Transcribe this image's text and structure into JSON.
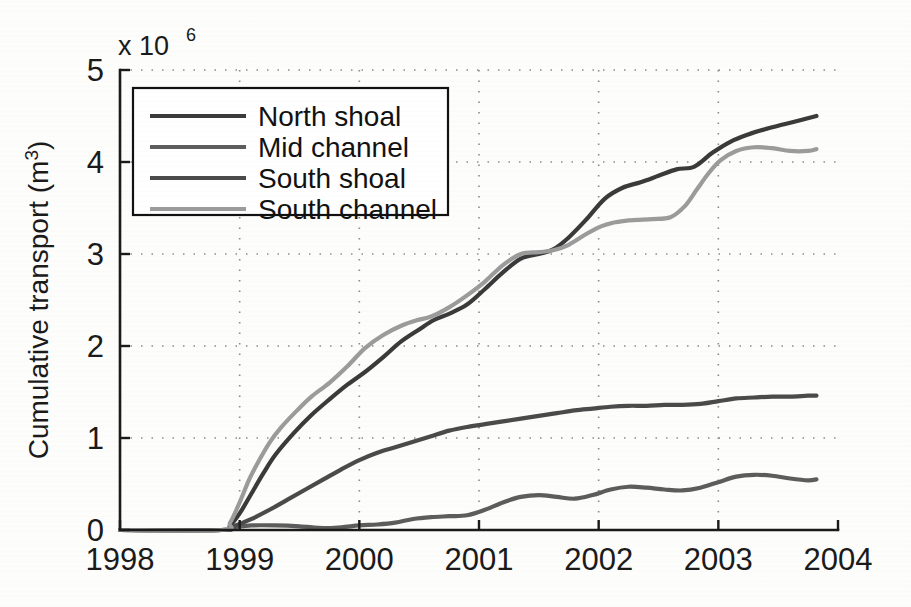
{
  "chart_data": {
    "type": "line",
    "title": "",
    "subtitle": "",
    "xlabel": "",
    "ylabel": "Cumulative transport (m",
    "ylabel_sup": "3",
    "ylabel_suffix": ")",
    "y_exponent_base": "x 10",
    "y_exponent_sup": "6",
    "y_scale_note": "Values in millions (x 10^6) of cubic metres",
    "xlim": [
      1998,
      2004
    ],
    "ylim": [
      0,
      5
    ],
    "xticks": [
      1998,
      1999,
      2000,
      2001,
      2002,
      2003,
      2004
    ],
    "xtick_labels": [
      "1998",
      "1999",
      "2000",
      "2001",
      "2002",
      "2003",
      "2004"
    ],
    "yticks": [
      0,
      1,
      2,
      3,
      4,
      5
    ],
    "ytick_labels": [
      "0",
      "1",
      "2",
      "3",
      "4",
      "5"
    ],
    "grid": true,
    "grid_style": "dotted",
    "legend_position": "upper-left",
    "legend_entries": [
      "North shoal",
      "Mid channel",
      "South shoal",
      "South channel"
    ],
    "series": [
      {
        "name": "North shoal",
        "color": "#3a3a3a",
        "x": [
          1998.0,
          1998.85,
          1998.92,
          1999.0,
          1999.1,
          1999.2,
          1999.3,
          1999.45,
          1999.6,
          1999.75,
          1999.9,
          2000.05,
          2000.2,
          2000.35,
          2000.5,
          2000.62,
          2000.75,
          2000.9,
          2001.05,
          2001.2,
          2001.35,
          2001.5,
          2001.62,
          2001.75,
          2001.9,
          2002.05,
          2002.2,
          2002.35,
          2002.5,
          2002.65,
          2002.8,
          2002.95,
          2003.1,
          2003.25,
          2003.4,
          2003.55,
          2003.7,
          2003.82
        ],
        "y": [
          0.0,
          0.0,
          0.05,
          0.18,
          0.4,
          0.62,
          0.82,
          1.05,
          1.25,
          1.42,
          1.58,
          1.72,
          1.88,
          2.05,
          2.18,
          2.28,
          2.35,
          2.45,
          2.62,
          2.8,
          2.95,
          3.0,
          3.05,
          3.18,
          3.38,
          3.6,
          3.72,
          3.78,
          3.85,
          3.92,
          3.95,
          4.1,
          4.22,
          4.3,
          4.36,
          4.41,
          4.46,
          4.5
        ]
      },
      {
        "name": "Mid channel",
        "color": "#5c5c5c",
        "x": [
          1998.0,
          1998.85,
          1998.95,
          1999.1,
          1999.3,
          1999.5,
          1999.7,
          1999.85,
          2000.0,
          2000.15,
          2000.3,
          2000.45,
          2000.6,
          2000.75,
          2000.9,
          2001.05,
          2001.2,
          2001.35,
          2001.5,
          2001.65,
          2001.8,
          2001.95,
          2002.1,
          2002.25,
          2002.4,
          2002.55,
          2002.7,
          2002.85,
          2003.0,
          2003.15,
          2003.3,
          2003.45,
          2003.6,
          2003.75,
          2003.82
        ],
        "y": [
          0.0,
          0.0,
          0.03,
          0.05,
          0.05,
          0.04,
          0.02,
          0.03,
          0.05,
          0.06,
          0.08,
          0.12,
          0.14,
          0.15,
          0.16,
          0.22,
          0.3,
          0.36,
          0.38,
          0.36,
          0.34,
          0.38,
          0.44,
          0.47,
          0.46,
          0.44,
          0.43,
          0.46,
          0.52,
          0.58,
          0.6,
          0.59,
          0.56,
          0.54,
          0.55
        ]
      },
      {
        "name": "South shoal",
        "color": "#4a4a4a",
        "x": [
          1998.0,
          1998.85,
          1998.95,
          1999.1,
          1999.25,
          1999.4,
          1999.55,
          1999.7,
          1999.85,
          2000.0,
          2000.15,
          2000.3,
          2000.45,
          2000.6,
          2000.75,
          2000.9,
          2001.05,
          2001.2,
          2001.35,
          2001.5,
          2001.65,
          2001.8,
          2001.95,
          2002.1,
          2002.25,
          2002.4,
          2002.55,
          2002.7,
          2002.85,
          2003.0,
          2003.15,
          2003.3,
          2003.45,
          2003.6,
          2003.75,
          2003.82
        ],
        "y": [
          0.0,
          0.0,
          0.04,
          0.12,
          0.22,
          0.33,
          0.44,
          0.55,
          0.66,
          0.76,
          0.84,
          0.9,
          0.96,
          1.02,
          1.08,
          1.12,
          1.15,
          1.18,
          1.21,
          1.24,
          1.27,
          1.3,
          1.32,
          1.34,
          1.35,
          1.35,
          1.36,
          1.36,
          1.37,
          1.4,
          1.43,
          1.44,
          1.45,
          1.45,
          1.46,
          1.46
        ]
      },
      {
        "name": "South channel",
        "color": "#9b9b9b",
        "x": [
          1998.0,
          1998.85,
          1998.92,
          1999.0,
          1999.08,
          1999.16,
          1999.25,
          1999.35,
          1999.48,
          1999.6,
          1999.75,
          1999.9,
          2000.05,
          2000.2,
          2000.35,
          2000.48,
          2000.6,
          2000.75,
          2000.9,
          2001.05,
          2001.2,
          2001.35,
          2001.5,
          2001.62,
          2001.75,
          2001.9,
          2002.02,
          2002.12,
          2002.22,
          2002.32,
          2002.45,
          2002.6,
          2002.72,
          2002.82,
          2002.92,
          2003.02,
          2003.15,
          2003.3,
          2003.45,
          2003.6,
          2003.75,
          2003.82
        ],
        "y": [
          0.0,
          0.0,
          0.08,
          0.3,
          0.55,
          0.75,
          0.95,
          1.12,
          1.3,
          1.45,
          1.6,
          1.78,
          1.98,
          2.12,
          2.22,
          2.28,
          2.32,
          2.42,
          2.55,
          2.7,
          2.88,
          3.0,
          3.02,
          3.04,
          3.1,
          3.22,
          3.3,
          3.34,
          3.36,
          3.37,
          3.38,
          3.4,
          3.52,
          3.7,
          3.88,
          4.02,
          4.12,
          4.16,
          4.15,
          4.12,
          4.12,
          4.14
        ]
      }
    ]
  },
  "plot_geometry": {
    "left_px": 120,
    "right_px": 838,
    "top_px": 70,
    "bottom_px": 530
  }
}
